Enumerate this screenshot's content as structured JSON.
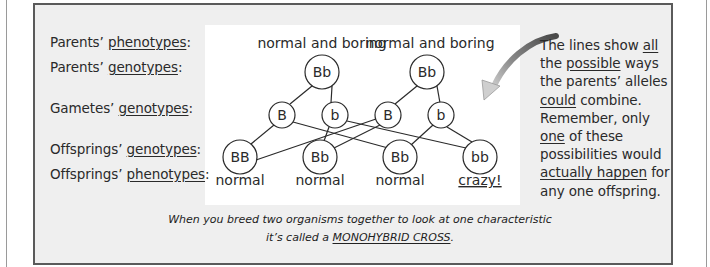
{
  "labels": {
    "parents_phenotypes": {
      "prefix": "Parents’ ",
      "term": "phenotypes",
      "suffix": ":"
    },
    "parents_genotypes": {
      "prefix": "Parents’ ",
      "term": "genotypes",
      "suffix": ":"
    },
    "gametes_genotypes": {
      "prefix": "Gametes’ ",
      "term": "genotypes",
      "suffix": ":"
    },
    "offsprings_genotypes": {
      "prefix": "Offsprings’ ",
      "term": "genotypes",
      "suffix": ":"
    },
    "offsprings_phenotypes": {
      "prefix": "Offsprings’ ",
      "term": "phenotypes",
      "suffix": ":"
    }
  },
  "diagram": {
    "parents": [
      {
        "phenotype": "normal and boring",
        "genotype": "Bb"
      },
      {
        "phenotype": "normal and boring",
        "genotype": "Bb"
      }
    ],
    "gametes": [
      "B",
      "b",
      "B",
      "b"
    ],
    "offspring": [
      {
        "genotype": "BB",
        "phenotype": "normal"
      },
      {
        "genotype": "Bb",
        "phenotype": "normal"
      },
      {
        "genotype": "Bb",
        "phenotype": "normal"
      },
      {
        "genotype": "bb",
        "phenotype": "crazy!"
      }
    ]
  },
  "note": {
    "t1": "The lines show ",
    "u1": "all",
    "t2": "the ",
    "u2": "possible",
    "t3": " ways",
    "t4": "the parents’ alleles",
    "u3": "could",
    "t5": " combine.",
    "t6": "Remember, only",
    "u4": "one",
    "t7": " of these",
    "t8": "possibilities would",
    "u5": "actually happen",
    "t9": " for",
    "t10": "any one offspring."
  },
  "caption": {
    "line1": "When you breed two organisms together to look at one characteristic",
    "line2_prefix": "it’s called a ",
    "line2_term": "MONOHYBRID CROSS",
    "line2_suffix": "."
  },
  "colors": {
    "box_fill": "#efefef",
    "box_border": "#5a5a5a",
    "panel_fill": "#ffffff",
    "text": "#2a2a2a",
    "arrow_dark": "#4a4a4a",
    "arrow_light": "#d8d8d8"
  }
}
